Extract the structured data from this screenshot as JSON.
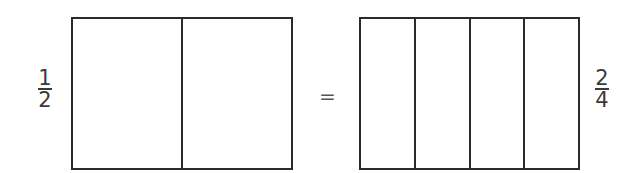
{
  "diagram": {
    "left": {
      "fraction": {
        "numerator": "1",
        "denominator": "2"
      },
      "parts": 2
    },
    "operator": "=",
    "right": {
      "fraction": {
        "numerator": "2",
        "denominator": "4"
      },
      "parts": 4
    }
  },
  "colors": {
    "stroke": "#2b2b2b",
    "text": "#3a3a3a",
    "background": "#ffffff"
  }
}
